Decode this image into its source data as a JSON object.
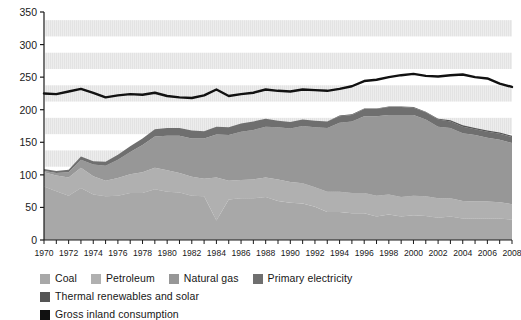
{
  "chart_data": {
    "type": "area",
    "title": "",
    "subtitle": "",
    "xlabel": "",
    "ylabel": "",
    "stacked": true,
    "grid": false,
    "banded_background": true,
    "legend_position": "bottom-left",
    "xlim": [
      1970,
      2008
    ],
    "ylim": [
      0,
      350
    ],
    "ytick_step": 50,
    "yticks": [
      0,
      50,
      100,
      150,
      200,
      250,
      300,
      350
    ],
    "xticks": [
      1970,
      1971,
      1972,
      1973,
      1974,
      1975,
      1976,
      1977,
      1978,
      1979,
      1980,
      1981,
      1982,
      1983,
      1984,
      1985,
      1986,
      1987,
      1988,
      1989,
      1990,
      1991,
      1992,
      1993,
      1994,
      1995,
      1996,
      1997,
      1998,
      1999,
      2000,
      2001,
      2002,
      2003,
      2004,
      2005,
      2006,
      2007,
      2008
    ],
    "xtick_labels": [
      "1970",
      "1972",
      "1974",
      "1976",
      "1978",
      "1980",
      "1982",
      "1984",
      "1986",
      "1988",
      "1990",
      "1992",
      "1994",
      "1996",
      "1998",
      "2000",
      "2002",
      "2004",
      "2006",
      "2008"
    ],
    "xtick_label_years": [
      1970,
      1972,
      1974,
      1976,
      1978,
      1980,
      1982,
      1984,
      1986,
      1988,
      1990,
      1992,
      1994,
      1996,
      1998,
      2000,
      2002,
      2004,
      2006,
      2008
    ],
    "x": [
      1970,
      1971,
      1972,
      1973,
      1974,
      1975,
      1976,
      1977,
      1978,
      1979,
      1980,
      1981,
      1982,
      1983,
      1984,
      1985,
      1986,
      1987,
      1988,
      1989,
      1990,
      1991,
      1992,
      1993,
      1994,
      1995,
      1996,
      1997,
      1998,
      1999,
      2000,
      2001,
      2002,
      2003,
      2004,
      2005,
      2006,
      2007,
      2008
    ],
    "series": [
      {
        "name": "Coal",
        "color": "#a8a8a8",
        "values": [
          82,
          75,
          68,
          80,
          70,
          67,
          68,
          72,
          72,
          78,
          74,
          73,
          68,
          67,
          30,
          62,
          64,
          64,
          66,
          60,
          57,
          56,
          51,
          43,
          43,
          41,
          41,
          36,
          39,
          36,
          38,
          37,
          34,
          36,
          33,
          33,
          33,
          33,
          31
        ]
      },
      {
        "name": "Petroleum",
        "color": "#b0b0b0",
        "values": [
          22,
          24,
          28,
          31,
          28,
          24,
          27,
          29,
          32,
          33,
          33,
          30,
          29,
          27,
          66,
          29,
          28,
          29,
          30,
          33,
          32,
          31,
          30,
          31,
          31,
          31,
          31,
          32,
          31,
          30,
          30,
          30,
          30,
          28,
          27,
          26,
          26,
          25,
          24
        ]
      },
      {
        "name": "Natural gas",
        "color": "#979797",
        "values": [
          2,
          4,
          8,
          12,
          18,
          23,
          28,
          34,
          42,
          48,
          53,
          57,
          59,
          62,
          66,
          70,
          74,
          76,
          78,
          80,
          82,
          88,
          92,
          98,
          106,
          110,
          118,
          122,
          122,
          126,
          124,
          118,
          110,
          108,
          104,
          102,
          98,
          96,
          94
        ]
      },
      {
        "name": "Primary electricity",
        "color": "#6f6f6f",
        "values": [
          3,
          3,
          4,
          5,
          5,
          6,
          8,
          9,
          10,
          11,
          12,
          12,
          12,
          11,
          12,
          12,
          13,
          13,
          12,
          10,
          10,
          10,
          10,
          10,
          10,
          10,
          11,
          11,
          12,
          12,
          11,
          11,
          11,
          10,
          10,
          9,
          9,
          9,
          9
        ]
      },
      {
        "name": "Thermal renewables and solar",
        "color": "#555555",
        "values": [
          0,
          0,
          0,
          0,
          0,
          0,
          0,
          0,
          0,
          0,
          0,
          0,
          0,
          0,
          0,
          0,
          0,
          0,
          0,
          0,
          0,
          0,
          0,
          0,
          1,
          1,
          1,
          1,
          1,
          1,
          1,
          1,
          1,
          2,
          2,
          2,
          2,
          2,
          2
        ]
      }
    ],
    "line_series": {
      "name": "Gross inland consumption",
      "color": "#111111",
      "values": [
        225,
        224,
        228,
        232,
        226,
        219,
        222,
        224,
        223,
        226,
        221,
        219,
        218,
        222,
        231,
        221,
        224,
        226,
        231,
        229,
        228,
        231,
        230,
        229,
        232,
        236,
        244,
        246,
        250,
        253,
        255,
        252,
        251,
        253,
        254,
        250,
        248,
        240,
        235
      ]
    },
    "stack_totals_note": "values in Mtoe"
  },
  "legend": {
    "items": [
      {
        "label": "Coal",
        "color": "#a8a8a8",
        "icon": "square-swatch-icon"
      },
      {
        "label": "Petroleum",
        "color": "#b0b0b0",
        "icon": "square-swatch-icon"
      },
      {
        "label": "Natural gas",
        "color": "#979797",
        "icon": "square-swatch-icon"
      },
      {
        "label": "Primary electricity",
        "color": "#6f6f6f",
        "icon": "square-swatch-icon"
      },
      {
        "label": "Thermal renewables and solar",
        "color": "#555555",
        "icon": "square-swatch-icon"
      },
      {
        "label": "Gross inland consumption",
        "color": "#111111",
        "icon": "square-swatch-icon"
      }
    ]
  }
}
